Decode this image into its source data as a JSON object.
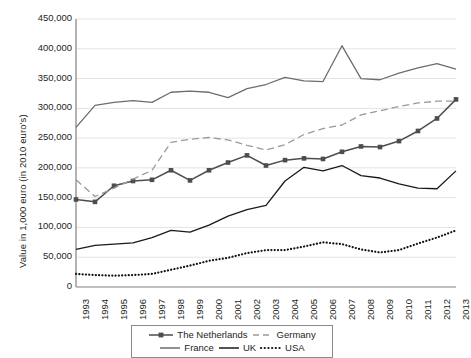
{
  "chart_data": {
    "type": "line",
    "title": "",
    "xlabel": "",
    "ylabel": "Value in 1,000 euro (in 2010 euro's)",
    "ylim": [
      0,
      450000
    ],
    "ytick_step": 50000,
    "grid": true,
    "legend_position": "bottom",
    "x": [
      1993,
      1994,
      1995,
      1996,
      1997,
      1998,
      1999,
      2000,
      2001,
      2002,
      2003,
      2004,
      2005,
      2006,
      2007,
      2008,
      2009,
      2010,
      2011,
      2012,
      2013
    ],
    "ytick_labels": [
      "450,000",
      "400,000",
      "350,000",
      "300,000",
      "250,000",
      "200,000",
      "150,000",
      "100,000",
      "50,000",
      "0"
    ],
    "xtick_labels": [
      "1993",
      "1994",
      "1995",
      "1996",
      "1997",
      "1998",
      "1999",
      "2000",
      "2001",
      "2002",
      "2003",
      "2004",
      "2005",
      "2006",
      "2007",
      "2008",
      "2009",
      "2010",
      "2011",
      "2012",
      "2013"
    ],
    "series": [
      {
        "name": "The Netherlands",
        "style": "solid-marker",
        "color": "#4d4d4d",
        "values": [
          147000,
          143000,
          170000,
          178000,
          180000,
          196000,
          179000,
          196000,
          209000,
          221000,
          204000,
          213000,
          216000,
          215000,
          227000,
          236000,
          235000,
          245000,
          262000,
          283000,
          315000
        ]
      },
      {
        "name": "Germany",
        "style": "dashed",
        "color": "#9a9a9a",
        "values": [
          180000,
          152000,
          166000,
          181000,
          196000,
          243000,
          248000,
          251000,
          247000,
          238000,
          230000,
          239000,
          256000,
          266000,
          272000,
          289000,
          296000,
          303000,
          309000,
          312000,
          312000
        ]
      },
      {
        "name": "France",
        "style": "solid-light",
        "color": "#6d6d6d",
        "values": [
          268000,
          305000,
          310000,
          313000,
          310000,
          327000,
          329000,
          327000,
          318000,
          333000,
          340000,
          352000,
          346000,
          345000,
          405000,
          350000,
          348000,
          359000,
          368000,
          375000,
          366000
        ]
      },
      {
        "name": "UK",
        "style": "solid-dark",
        "color": "#1a1a1a",
        "values": [
          63000,
          70000,
          72000,
          74000,
          83000,
          95000,
          92000,
          104000,
          119000,
          130000,
          137000,
          178000,
          201000,
          195000,
          204000,
          187000,
          183000,
          173000,
          166000,
          165000,
          195000
        ]
      },
      {
        "name": "USA",
        "style": "dotted",
        "color": "#111111",
        "values": [
          22000,
          20000,
          19000,
          20000,
          22000,
          29000,
          36000,
          44000,
          49000,
          57000,
          62000,
          62000,
          68000,
          75000,
          72000,
          63000,
          58000,
          62000,
          73000,
          83000,
          95000
        ]
      }
    ]
  },
  "legend": {
    "row1": [
      {
        "label": "The Netherlands",
        "style": "solid-marker",
        "color": "#4d4d4d"
      },
      {
        "label": "Germany",
        "style": "dashed",
        "color": "#9a9a9a"
      }
    ],
    "row2": [
      {
        "label": "France",
        "style": "solid-light",
        "color": "#6d6d6d"
      },
      {
        "label": "UK",
        "style": "solid-dark",
        "color": "#1a1a1a"
      },
      {
        "label": "USA",
        "style": "dotted",
        "color": "#111111"
      }
    ]
  },
  "axes": {
    "gridline_color": "#e3e3e3",
    "axis_color": "#808080"
  }
}
